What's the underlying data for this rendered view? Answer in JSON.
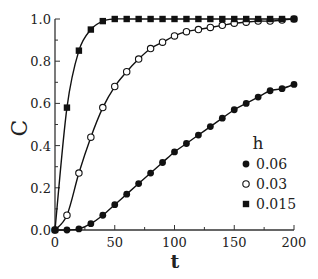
{
  "chart_data": {
    "type": "line",
    "title": "",
    "xlabel": "t",
    "ylabel": "C",
    "xlim": [
      0,
      200
    ],
    "ylim": [
      0.0,
      1.0
    ],
    "xticks": [
      0,
      50,
      100,
      150,
      200
    ],
    "xtick_labels": [
      "0",
      "50",
      "100",
      "150",
      "200"
    ],
    "yticks": [
      0.0,
      0.2,
      0.4,
      0.6,
      0.8,
      1.0
    ],
    "ytick_labels": [
      "0.0",
      "0.2",
      "0.4",
      "0.6",
      "0.8",
      "1.0"
    ],
    "grid": false,
    "legend_title": "h",
    "legend_position": "lower right",
    "x": [
      0,
      10,
      20,
      30,
      40,
      50,
      60,
      70,
      80,
      90,
      100,
      110,
      120,
      130,
      140,
      150,
      160,
      170,
      180,
      190,
      200
    ],
    "series": [
      {
        "name": "0.06",
        "marker": "filled-circle",
        "values": [
          0,
          0.0,
          0.005,
          0.03,
          0.07,
          0.12,
          0.17,
          0.22,
          0.27,
          0.32,
          0.37,
          0.41,
          0.45,
          0.49,
          0.53,
          0.57,
          0.6,
          0.63,
          0.66,
          0.67,
          0.69
        ]
      },
      {
        "name": "0.03",
        "marker": "open-circle",
        "values": [
          0,
          0.07,
          0.27,
          0.44,
          0.58,
          0.68,
          0.75,
          0.81,
          0.86,
          0.89,
          0.92,
          0.94,
          0.95,
          0.96,
          0.97,
          0.98,
          0.985,
          0.99,
          0.99,
          0.995,
          1.0
        ]
      },
      {
        "name": "0.015",
        "marker": "filled-square",
        "values": [
          0,
          0.58,
          0.85,
          0.95,
          0.99,
          1.0,
          1.0,
          1.0,
          1.0,
          1.0,
          1.0,
          1.0,
          1.0,
          1.0,
          1.0,
          1.0,
          1.0,
          1.0,
          1.0,
          1.0,
          1.0
        ]
      }
    ]
  }
}
